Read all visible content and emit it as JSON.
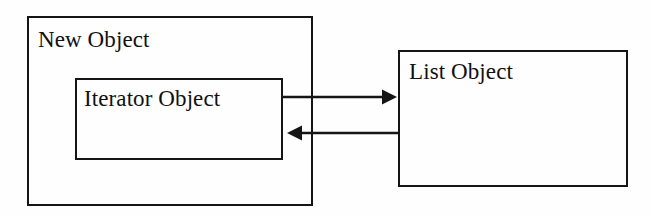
{
  "diagram": {
    "background_color": "#fefefe",
    "line_color": "#151515",
    "text_color": "#111111",
    "nodes": [
      {
        "id": "new-object",
        "label": "New Object",
        "role": "outer-container",
        "x": 27,
        "y": 16,
        "width": 286,
        "height": 190
      },
      {
        "id": "iterator-object",
        "label": "Iterator Object",
        "role": "inner-box",
        "x": 75,
        "y": 78,
        "width": 208,
        "height": 82
      },
      {
        "id": "list-object",
        "label": "List Object",
        "role": "box",
        "x": 398,
        "y": 50,
        "width": 230,
        "height": 137
      }
    ],
    "connectors": [
      {
        "id": "iterator-to-list",
        "label": "",
        "from": "iterator-object",
        "to": "list-object",
        "direction": "right",
        "arrowhead": "solid-triangle",
        "x1": 283,
        "y1": 97,
        "x2": 398,
        "y2": 97
      },
      {
        "id": "list-to-iterator",
        "label": "",
        "from": "list-object",
        "to": "iterator-object",
        "direction": "left",
        "arrowhead": "solid-triangle",
        "x1": 398,
        "y1": 133,
        "x2": 283,
        "y2": 133
      }
    ]
  }
}
